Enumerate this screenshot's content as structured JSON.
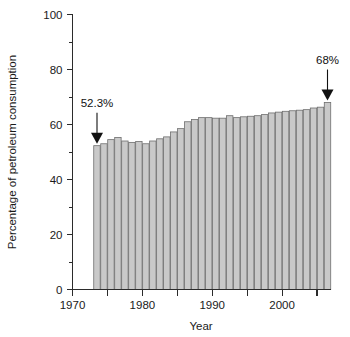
{
  "chart_data": {
    "type": "bar",
    "title": "",
    "xlabel": "Year",
    "ylabel": "Percentage of petroleum consumption",
    "xlim": [
      1970,
      2007
    ],
    "ylim": [
      0,
      100
    ],
    "grid": false,
    "legend": "none",
    "y_ticks_major": [
      0,
      20,
      40,
      60,
      80,
      100
    ],
    "y_ticks_minor": [
      10,
      30,
      50,
      70,
      90
    ],
    "x_ticks_major": [
      1970,
      1975,
      1980,
      1985,
      1990,
      1995,
      2000,
      2005
    ],
    "x_tick_labels": [
      "1970",
      "",
      "1980",
      "",
      "1990",
      "",
      "2000",
      ""
    ],
    "categories": [
      "1973",
      "1974",
      "1975",
      "1976",
      "1977",
      "1978",
      "1979",
      "1980",
      "1981",
      "1982",
      "1983",
      "1984",
      "1985",
      "1986",
      "1987",
      "1988",
      "1989",
      "1990",
      "1991",
      "1992",
      "1993",
      "1994",
      "1995",
      "1996",
      "1997",
      "1998",
      "1999",
      "2000",
      "2001",
      "2002",
      "2003",
      "2004",
      "2005",
      "2006"
    ],
    "values": [
      52.3,
      53.0,
      54.5,
      55.3,
      54.0,
      53.5,
      53.8,
      53.0,
      54.0,
      54.8,
      55.5,
      57.3,
      58.5,
      61.0,
      61.8,
      62.5,
      62.5,
      62.3,
      62.3,
      63.2,
      62.5,
      62.8,
      63.0,
      63.2,
      63.6,
      64.2,
      64.5,
      64.8,
      65.0,
      65.2,
      65.4,
      66.0,
      66.3,
      68.0
    ],
    "annotations": [
      {
        "label": "52.3%",
        "year": 1973,
        "value": 52.3
      },
      {
        "label": "68%",
        "year": 2006,
        "value": 68.0
      }
    ]
  }
}
